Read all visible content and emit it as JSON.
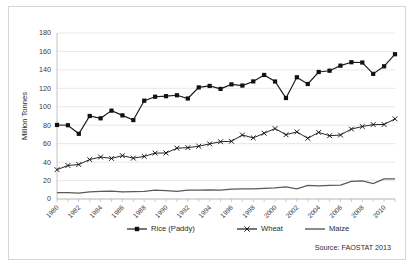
{
  "card": {
    "source_note": "Source: FAOSTAT 2013"
  },
  "chart_data": {
    "type": "line",
    "title": "",
    "xlabel": "",
    "ylabel": "Million Tonnes",
    "ylim": [
      0,
      180
    ],
    "ytick_step": 20,
    "yticks": [
      "0",
      "20",
      "40",
      "60",
      "80",
      "100",
      "120",
      "140",
      "160",
      "180"
    ],
    "grid": true,
    "legend_position": "bottom",
    "x": [
      1980,
      1981,
      1982,
      1983,
      1984,
      1985,
      1986,
      1987,
      1988,
      1989,
      1990,
      1991,
      1992,
      1993,
      1994,
      1995,
      1996,
      1997,
      1998,
      1999,
      2000,
      2001,
      2002,
      2003,
      2004,
      2005,
      2006,
      2007,
      2008,
      2009,
      2010,
      2011
    ],
    "xtick_labels": [
      "1980",
      "1982",
      "1984",
      "1986",
      "1988",
      "1990",
      "1992",
      "1994",
      "1996",
      "1998",
      "2000",
      "2002",
      "2004",
      "2006",
      "2008",
      "2010"
    ],
    "xtick_label_every": 2,
    "series": [
      {
        "name": "Rice (Paddy)",
        "marker": "square",
        "color": "#111111",
        "values": [
          80.3,
          80.0,
          70.7,
          90.0,
          87.5,
          95.8,
          90.7,
          85.6,
          106.6,
          110.9,
          111.5,
          112.5,
          109.0,
          121.0,
          122.6,
          119.4,
          124.3,
          123.0,
          127.5,
          134.5,
          127.4,
          109.5,
          132.0,
          124.7,
          137.7,
          139.1,
          144.6,
          148.3,
          148.0,
          135.7,
          143.9,
          157.0
        ]
      },
      {
        "name": "Wheat",
        "marker": "x",
        "color": "#111111",
        "values": [
          31.8,
          36.3,
          37.4,
          42.8,
          45.5,
          44.0,
          47.0,
          44.3,
          46.2,
          49.7,
          49.9,
          55.1,
          55.7,
          57.2,
          59.8,
          62.1,
          62.6,
          69.4,
          66.3,
          71.3,
          76.4,
          69.7,
          72.8,
          65.8,
          72.2,
          68.6,
          69.4,
          75.8,
          78.6,
          80.7,
          80.8,
          86.9
        ]
      },
      {
        "name": "Maize",
        "marker": "none",
        "color": "#5a5a5a",
        "values": [
          6.9,
          6.8,
          6.5,
          7.7,
          8.2,
          8.4,
          7.6,
          8.1,
          8.2,
          9.6,
          9.0,
          8.4,
          9.7,
          9.5,
          10.0,
          9.5,
          10.8,
          10.9,
          11.1,
          11.5,
          12.0,
          13.2,
          11.1,
          14.7,
          14.2,
          14.7,
          15.1,
          19.0,
          19.7,
          16.7,
          21.7,
          21.8
        ]
      }
    ]
  }
}
